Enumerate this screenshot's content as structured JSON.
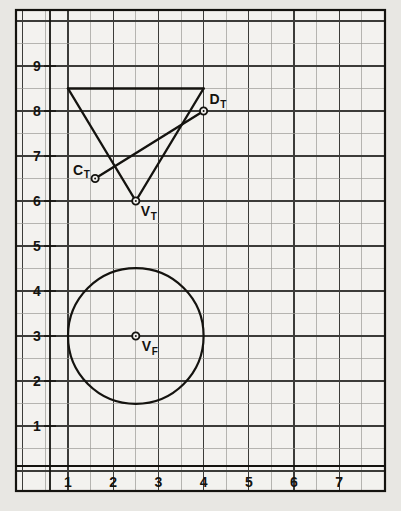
{
  "figure": {
    "background_color": "#e8e7e3",
    "paper_color": "#f3f2ef",
    "grid_minor_color": "#9a9a96",
    "grid_major_color": "#3c3c39",
    "ink_color": "#14130f",
    "frame": {
      "x": 16,
      "y": 10,
      "width": 369,
      "height": 481
    }
  },
  "chart_data": {
    "type": "scatter",
    "title": "",
    "xlabel": "",
    "ylabel": "",
    "xlim": [
      0.3,
      7.7
    ],
    "ylim": [
      0.4,
      9.7
    ],
    "grid": true,
    "grid_minor_step": 0.5,
    "grid_major_step": 1,
    "legend": "none",
    "xticks": [
      "1",
      "2",
      "3",
      "4",
      "5",
      "6",
      "7"
    ],
    "xtick_values": [
      1,
      2,
      3,
      4,
      5,
      6,
      7
    ],
    "yticks": [
      "1",
      "2",
      "3",
      "4",
      "5",
      "6",
      "7",
      "8",
      "9"
    ],
    "ytick_values": [
      1,
      2,
      3,
      4,
      5,
      6,
      7,
      8,
      9
    ],
    "points": [
      {
        "name": "C_T",
        "label": "C",
        "sub": "T",
        "x": 1.6,
        "y": 6.5,
        "label_dx": -22,
        "label_dy": -4
      },
      {
        "name": "D_T",
        "label": "D",
        "sub": "T",
        "x": 4.0,
        "y": 8.0,
        "label_dx": 6,
        "label_dy": -7
      },
      {
        "name": "V_T",
        "label": "V",
        "sub": "T",
        "x": 2.5,
        "y": 6.0,
        "label_dx": 5,
        "label_dy": 15
      },
      {
        "name": "V_F",
        "label": "V",
        "sub": "F",
        "x": 2.5,
        "y": 3.0,
        "label_dx": 6,
        "label_dy": 15
      }
    ],
    "polylines": [
      {
        "name": "triangle-top-edge",
        "points": [
          [
            1.0,
            8.5
          ],
          [
            4.0,
            8.5
          ]
        ]
      },
      {
        "name": "triangle-left-edge",
        "points": [
          [
            1.0,
            8.5
          ],
          [
            2.5,
            6.0
          ]
        ]
      },
      {
        "name": "triangle-right-edge",
        "points": [
          [
            2.5,
            6.0
          ],
          [
            4.0,
            8.5
          ]
        ]
      },
      {
        "name": "chord-CT-DT",
        "points": [
          [
            1.6,
            6.5
          ],
          [
            4.0,
            8.0
          ]
        ]
      }
    ],
    "circles": [
      {
        "name": "front-view-circle",
        "cx": 2.5,
        "cy": 3.0,
        "r": 1.5
      }
    ]
  }
}
